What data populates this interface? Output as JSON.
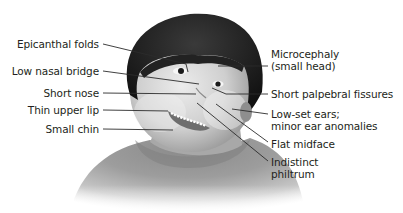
{
  "figure": {
    "left_labels": [
      {
        "text": "Epicanthal folds",
        "target": "inner eye corner"
      },
      {
        "text": "Low nasal bridge",
        "target": "nasal bridge"
      },
      {
        "text": "Short nose",
        "target": "nose"
      },
      {
        "text": "Thin upper lip",
        "target": "upper lip"
      },
      {
        "text": "Small chin",
        "target": "chin"
      }
    ],
    "right_labels": [
      {
        "lines": [
          "Microcephaly",
          "(small head)"
        ],
        "target": "forehead"
      },
      {
        "lines": [
          "Short palpebral fissures"
        ],
        "target": "eye"
      },
      {
        "lines": [
          "Low-set ears;",
          "minor ear anomalies"
        ],
        "target": "ear"
      },
      {
        "lines": [
          "Flat midface"
        ],
        "target": "cheek"
      },
      {
        "lines": [
          "Indistinct",
          "philtrum"
        ],
        "target": "philtrum"
      }
    ]
  },
  "colors": {
    "text": "#231f20",
    "leader_line": "#2b2b2b",
    "hair": "#1e1e1e",
    "skin_light": "#e4e4e4",
    "skin_shadow": "#9a9a9a",
    "background": "#ffffff"
  }
}
